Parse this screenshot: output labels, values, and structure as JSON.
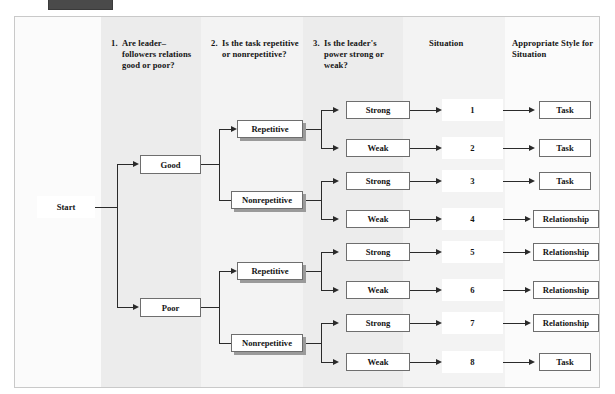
{
  "figure": {
    "type": "decision-flowchart",
    "title_bar_present": true
  },
  "columns": [
    {
      "number": "1.",
      "text": "Are leader–followers rela­tions good or poor?",
      "name": "column-header-relations"
    },
    {
      "number": "2.",
      "text": "Is the task repetitive or nonrepetitive?",
      "name": "column-header-task"
    },
    {
      "number": "3.",
      "text": "Is the leader's power strong or weak?",
      "name": "column-header-power"
    },
    {
      "number": "",
      "text": "Situation",
      "name": "column-header-situation"
    },
    {
      "number": "",
      "text": "Appropriate Style for Situation",
      "name": "column-header-style"
    }
  ],
  "start": {
    "label": "Start"
  },
  "relations": [
    {
      "label": "Good"
    },
    {
      "label": "Poor"
    }
  ],
  "tasks": [
    {
      "label": "Repetitive"
    },
    {
      "label": "Nonrepetitive"
    },
    {
      "label": "Repetitive"
    },
    {
      "label": "Nonrepetitive"
    }
  ],
  "power": [
    {
      "label": "Strong"
    },
    {
      "label": "Weak"
    },
    {
      "label": "Strong"
    },
    {
      "label": "Weak"
    },
    {
      "label": "Strong"
    },
    {
      "label": "Weak"
    },
    {
      "label": "Strong"
    },
    {
      "label": "Weak"
    }
  ],
  "situations": [
    {
      "number": "1"
    },
    {
      "number": "2"
    },
    {
      "number": "3"
    },
    {
      "number": "4"
    },
    {
      "number": "5"
    },
    {
      "number": "6"
    },
    {
      "number": "7"
    },
    {
      "number": "8"
    }
  ],
  "styles": [
    {
      "label": "Task"
    },
    {
      "label": "Task"
    },
    {
      "label": "Task"
    },
    {
      "label": "Relationship"
    },
    {
      "label": "Relationship"
    },
    {
      "label": "Relationship"
    },
    {
      "label": "Relationship"
    },
    {
      "label": "Task"
    }
  ],
  "rows": [
    {
      "relation": "Good",
      "task": "Repetitive",
      "power": "Strong",
      "situation": "1",
      "style": "Task"
    },
    {
      "relation": "Good",
      "task": "Repetitive",
      "power": "Weak",
      "situation": "2",
      "style": "Task"
    },
    {
      "relation": "Good",
      "task": "Nonrepetitive",
      "power": "Strong",
      "situation": "3",
      "style": "Task"
    },
    {
      "relation": "Good",
      "task": "Nonrepetitive",
      "power": "Weak",
      "situation": "4",
      "style": "Relationship"
    },
    {
      "relation": "Poor",
      "task": "Repetitive",
      "power": "Strong",
      "situation": "5",
      "style": "Relationship"
    },
    {
      "relation": "Poor",
      "task": "Repetitive",
      "power": "Weak",
      "situation": "6",
      "style": "Relationship"
    },
    {
      "relation": "Poor",
      "task": "Nonrepetitive",
      "power": "Strong",
      "situation": "7",
      "style": "Relationship"
    },
    {
      "relation": "Poor",
      "task": "Nonrepetitive",
      "power": "Weak",
      "situation": "8",
      "style": "Task"
    }
  ],
  "colors": {
    "page_background": "#ffffff",
    "frame_background": "#fbfbfb",
    "band_shade": "#ececec",
    "band_shade_light": "#f3f3f3",
    "box_border": "#6e6e6e",
    "box_fill": "#ffffff",
    "shadow": "#9a9a9a",
    "line": "#2a2a2a",
    "text": "#141414",
    "top_bar": "#4a4a4a"
  }
}
